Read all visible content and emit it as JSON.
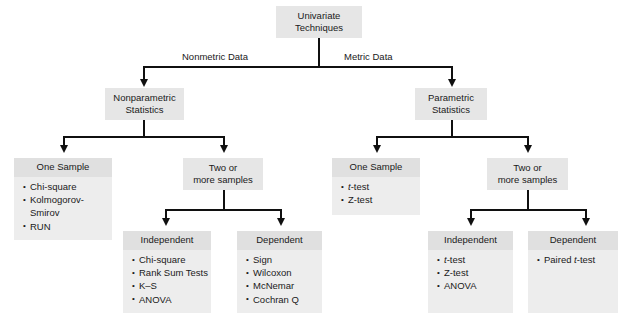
{
  "diagram": {
    "colors": {
      "node_header": "#e0e0e0",
      "node_body": "#ededed",
      "connector": "#101010",
      "background": "#ffffff"
    },
    "root": {
      "line1": "Univariate",
      "line2": "Techniques"
    },
    "edge_labels": {
      "left": "Nonmetric Data",
      "right": "Metric Data"
    },
    "branches": {
      "nonparametric": {
        "line1": "Nonparametric",
        "line2": "Statistics"
      },
      "parametric": {
        "line1": "Parametric",
        "line2": "Statistics"
      }
    },
    "groups": {
      "nonmetric_one_sample": {
        "line1": "One Sample",
        "line2": ""
      },
      "nonmetric_two_or_more": {
        "line1": "Two or",
        "line2": "more samples"
      },
      "metric_one_sample": {
        "line1": "One Sample",
        "line2": ""
      },
      "metric_two_or_more": {
        "line1": "Two or",
        "line2": "more samples"
      }
    },
    "panels": {
      "nonmetric_one_sample": {
        "header": "One Sample",
        "items": [
          "Chi-square",
          "Kolmogorov-",
          "Smirov",
          "RUN"
        ],
        "item_flags": [
          "bullet",
          "bullet",
          "cont",
          "bullet"
        ]
      },
      "nonmetric_independent": {
        "header": "Independent",
        "items": [
          "Chi-square",
          "Rank Sum Tests",
          "K–S",
          "ANOVA"
        ],
        "item_flags": [
          "bullet",
          "bullet",
          "bullet",
          "bullet"
        ]
      },
      "nonmetric_dependent": {
        "header": "Dependent",
        "items": [
          "Sign",
          "Wilcoxon",
          "McNemar",
          "Cochran Q"
        ],
        "item_flags": [
          "bullet",
          "bullet",
          "bullet",
          "bullet"
        ]
      },
      "metric_one_sample": {
        "header": "One Sample",
        "items": [
          "t-test",
          "Z-test"
        ],
        "item_flags": [
          "bullet-italic-first",
          "bullet"
        ]
      },
      "metric_independent": {
        "header": "Independent",
        "items": [
          "t-test",
          "Z-test",
          "ANOVA"
        ],
        "item_flags": [
          "bullet-italic-first",
          "bullet",
          "bullet"
        ]
      },
      "metric_dependent": {
        "header": "Dependent",
        "items": [
          "Paired t-test"
        ],
        "item_flags": [
          "bullet-italic-t"
        ]
      }
    }
  }
}
